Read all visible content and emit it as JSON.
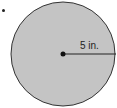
{
  "diagram": {
    "shape": "circle",
    "fill_color": "#c4c4c4",
    "stroke_color": "#333333",
    "radius_label": "5 in.",
    "radius_value": 5,
    "radius_unit": "in."
  }
}
